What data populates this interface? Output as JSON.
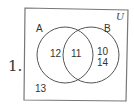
{
  "problem_number": "1.",
  "universe_label": "U",
  "sets": [
    {
      "label": "A",
      "only_value": "12"
    },
    {
      "label": "B",
      "only_values": [
        "10",
        "14"
      ]
    }
  ],
  "intersection_value": "11",
  "outside_value": "13",
  "colors": {
    "stroke": "#555555",
    "text": "#333333",
    "background": "#ffffff"
  }
}
